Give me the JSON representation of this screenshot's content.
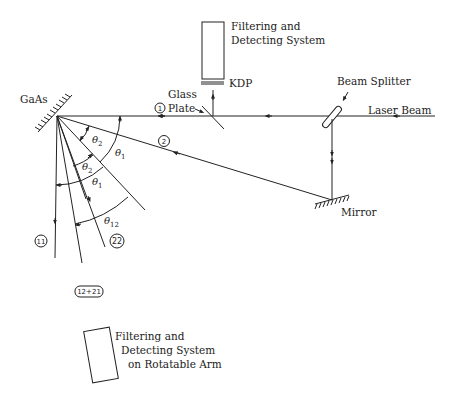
{
  "diagram": {
    "title": "",
    "labels": {
      "gaas": "GaAs",
      "glass_plate_line1": "Glass",
      "glass_plate_line2": "Plate",
      "kdp": "KDP",
      "top_detector_line1": "Filtering and",
      "top_detector_line2": "Detecting System",
      "beam_splitter": "Beam Splitter",
      "laser_beam": "Laser Beam",
      "mirror": "Mirror",
      "bottom_detector_line1": "Filtering and",
      "bottom_detector_line2": "Detecting System",
      "bottom_detector_line3": "on Rotatable Arm"
    },
    "beam_markers": {
      "beam1": "1",
      "beam2": "2",
      "beam11": "11",
      "beam22": "22",
      "beam12_21": "12+21"
    },
    "angles": {
      "theta1": "θ",
      "theta1_sub": "1",
      "theta2": "θ",
      "theta2_sub": "2",
      "theta12": "θ",
      "theta12_sub": "12"
    },
    "colors": {
      "ink": "#222222",
      "background": "#ffffff"
    }
  }
}
